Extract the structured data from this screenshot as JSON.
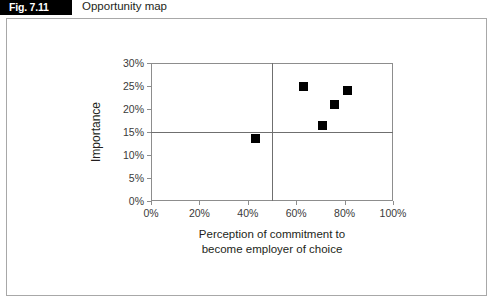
{
  "figure": {
    "label": "Fig. 7.11",
    "title": "Opportunity map"
  },
  "chart_data": {
    "type": "scatter",
    "title": "Opportunity map",
    "xlabel": "Perception of commitment to become employer of choice",
    "xlabel_line1": "Perception of commitment to",
    "xlabel_line2": "become employer of choice",
    "ylabel": "Importance",
    "xlim": [
      0,
      100
    ],
    "ylim": [
      0,
      30
    ],
    "xticks": [
      0,
      20,
      40,
      60,
      80,
      100
    ],
    "yticks": [
      0,
      5,
      10,
      15,
      20,
      25,
      30
    ],
    "xticklabels": [
      "0%",
      "20%",
      "40%",
      "60%",
      "80%",
      "100%"
    ],
    "yticklabels": [
      "0%",
      "5%",
      "10%",
      "15%",
      "20%",
      "25%",
      "30%"
    ],
    "grid": false,
    "legend": "none",
    "marker": "square",
    "marker_color": "#000000",
    "reference_lines": [
      {
        "axis": "y",
        "value": 15,
        "label": "15%"
      },
      {
        "axis": "x",
        "value": 50,
        "label": "50%"
      }
    ],
    "points": [
      {
        "x": 43,
        "y": 13.5
      },
      {
        "x": 63,
        "y": 25
      },
      {
        "x": 71,
        "y": 16.5
      },
      {
        "x": 76,
        "y": 21
      },
      {
        "x": 81,
        "y": 24
      }
    ]
  }
}
